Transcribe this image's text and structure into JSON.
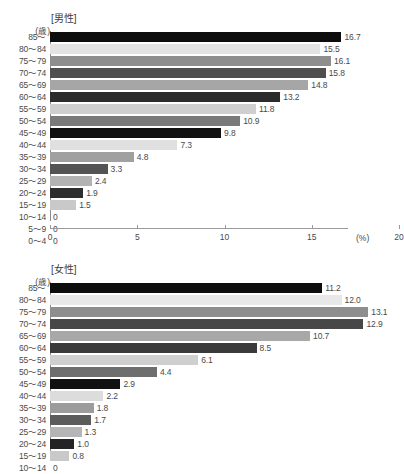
{
  "header": {
    "clipped_text": ""
  },
  "chart_data": [
    {
      "type": "bar",
      "orientation": "horizontal",
      "title": "[男性]",
      "unit_label": "(歳)",
      "xlabel": "(%)",
      "ylabel": "",
      "categories": [
        "85～",
        "80～84",
        "75～79",
        "70～74",
        "65～69",
        "60～64",
        "55～59",
        "50～54",
        "45～49",
        "40～44",
        "35～39",
        "30～34",
        "25～29",
        "20～24",
        "15～19",
        "10～14",
        "5～9",
        "0～4"
      ],
      "values": [
        16.7,
        15.5,
        16.1,
        15.8,
        14.8,
        13.2,
        11.8,
        10.9,
        9.8,
        7.3,
        4.8,
        3.3,
        2.4,
        1.9,
        1.5,
        0,
        0,
        0
      ],
      "value_labels": [
        "16.7",
        "15.5",
        "16.1",
        "15.8",
        "14.8",
        "13.2",
        "11.8",
        "10.9",
        "9.8",
        "7.3",
        "4.8",
        "3.3",
        "2.4",
        "1.9",
        "1.5",
        "0",
        "0",
        "0"
      ],
      "colors": [
        "#0d0d0d",
        "#e3e3e3",
        "#8e8e8e",
        "#4f4f4f",
        "#a6a6a6",
        "#2b2b2b",
        "#cfcfcf",
        "#7a7a7a",
        "#111111",
        "#e0e0e0",
        "#a0a0a0",
        "#545454",
        "#b3b3b3",
        "#2e2e2e",
        "#c9c9c9",
        "#ffffff",
        "#ffffff",
        "#ffffff"
      ],
      "xticks": [
        0,
        5,
        10,
        15,
        20
      ],
      "xticklabels": [
        "0",
        "5",
        "10",
        "15",
        "20"
      ],
      "xlim": [
        0,
        20
      ],
      "grid": false,
      "legend": "none",
      "axis_visible": true
    },
    {
      "type": "bar",
      "orientation": "horizontal",
      "title": "[女性]",
      "unit_label": "(歳)",
      "xlabel": "",
      "ylabel": "",
      "categories": [
        "85～",
        "80～84",
        "75～79",
        "70～74",
        "65～69",
        "60～64",
        "55～59",
        "50～54",
        "45～49",
        "40～44",
        "35～39",
        "30～34",
        "25～29",
        "20～24",
        "15～19",
        "10～14"
      ],
      "values": [
        11.2,
        12.0,
        13.1,
        12.9,
        10.7,
        8.5,
        6.1,
        4.4,
        2.9,
        2.2,
        1.8,
        1.7,
        1.3,
        1.0,
        0.8,
        0
      ],
      "value_labels": [
        "11.2",
        "12.0",
        "13.1",
        "12.9",
        "10.7",
        "8.5",
        "6.1",
        "4.4",
        "2.9",
        "2.2",
        "1.8",
        "1.7",
        "1.3",
        "1.0",
        "0.8",
        "0"
      ],
      "colors": [
        "#0d0d0d",
        "#e8e8e8",
        "#8e8e8e",
        "#474747",
        "#a8a8a8",
        "#3a3a3a",
        "#cfcfcf",
        "#6e6e6e",
        "#111111",
        "#dcdcdc",
        "#9c9c9c",
        "#5c5c5c",
        "#b5b5b5",
        "#242424",
        "#c9c9c9",
        "#ffffff"
      ],
      "xticks": [],
      "xticklabels": [],
      "xlim": [
        0,
        14.2
      ],
      "grid": false,
      "legend": "none",
      "axis_visible": false,
      "note": "x-axis cropped out of frame at bottom of screenshot"
    }
  ]
}
